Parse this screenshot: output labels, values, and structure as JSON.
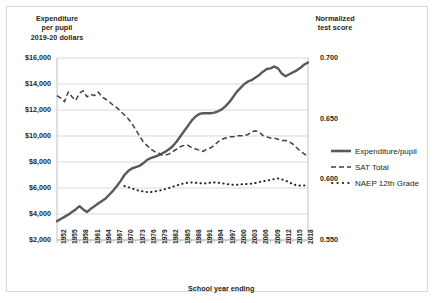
{
  "chart_data": {
    "type": "line",
    "title": "",
    "xlabel": "School year ending",
    "left_axis_title": "Expenditure\nper pupil\n2019-20 dollars",
    "left_axis_title_lines": [
      "Expenditure",
      "per pupil",
      "2019-20 dollars"
    ],
    "right_axis_title_lines": [
      "Normalized",
      "test score"
    ],
    "grid": true,
    "legend_position": "right",
    "y_left": {
      "label": "Expenditure per pupil 2019-20 dollars",
      "ticks": [
        "$2,000",
        "$4,000",
        "$6,000",
        "$8,000",
        "$10,000",
        "$12,000",
        "$14,000",
        "$16,000"
      ],
      "tick_values": [
        2000,
        4000,
        6000,
        8000,
        10000,
        12000,
        14000,
        16000
      ],
      "ylim": [
        2000,
        16000
      ]
    },
    "y_right": {
      "label": "Normalized test score",
      "ticks": [
        "0.550",
        "0.600",
        "0.650",
        "0.700"
      ],
      "tick_values": [
        0.55,
        0.6,
        0.65,
        0.7
      ],
      "ylim": [
        0.55,
        0.7
      ]
    },
    "x_ticks": [
      "1952",
      "1955",
      "1958",
      "1961",
      "1964",
      "1967",
      "1970",
      "1973",
      "1976",
      "1979",
      "1982",
      "1985",
      "1988",
      "1991",
      "1994",
      "1997",
      "2000",
      "2003",
      "2006",
      "2009",
      "2012",
      "2015",
      "2018"
    ],
    "xlim": [
      1952,
      2019
    ],
    "series": [
      {
        "name": "Expenditure/pupil",
        "axis": "left",
        "style": "solid",
        "color": "#595959",
        "x": [
          1952,
          1953,
          1954,
          1955,
          1956,
          1957,
          1958,
          1959,
          1960,
          1961,
          1962,
          1963,
          1964,
          1965,
          1966,
          1967,
          1968,
          1969,
          1970,
          1971,
          1972,
          1973,
          1974,
          1975,
          1976,
          1977,
          1978,
          1979,
          1980,
          1981,
          1982,
          1983,
          1984,
          1985,
          1986,
          1987,
          1988,
          1989,
          1990,
          1991,
          1992,
          1993,
          1994,
          1995,
          1996,
          1997,
          1998,
          1999,
          2000,
          2001,
          2002,
          2003,
          2004,
          2005,
          2006,
          2007,
          2008,
          2009,
          2010,
          2011,
          2012,
          2013,
          2014,
          2015,
          2016,
          2017,
          2018,
          2019
        ],
        "values": [
          3450,
          3620,
          3780,
          3950,
          4150,
          4350,
          4600,
          4350,
          4150,
          4400,
          4600,
          4800,
          5000,
          5200,
          5500,
          5800,
          6150,
          6550,
          7000,
          7300,
          7500,
          7600,
          7700,
          7900,
          8150,
          8300,
          8400,
          8500,
          8650,
          8800,
          9000,
          9250,
          9600,
          10000,
          10400,
          10800,
          11200,
          11500,
          11700,
          11750,
          11750,
          11750,
          11800,
          11900,
          12050,
          12300,
          12600,
          13000,
          13400,
          13700,
          14000,
          14200,
          14300,
          14500,
          14700,
          14950,
          15150,
          15200,
          15350,
          15200,
          14800,
          14600,
          14750,
          14900,
          15050,
          15250,
          15500,
          15650
        ]
      },
      {
        "name": "SAT Total",
        "axis": "right",
        "style": "dashed",
        "color": "#404040",
        "x": [
          1952,
          1953,
          1954,
          1955,
          1956,
          1957,
          1958,
          1959,
          1960,
          1961,
          1962,
          1963,
          1964,
          1965,
          1966,
          1967,
          1968,
          1969,
          1970,
          1971,
          1972,
          1973,
          1974,
          1975,
          1976,
          1977,
          1978,
          1979,
          1980,
          1981,
          1982,
          1983,
          1984,
          1985,
          1986,
          1987,
          1988,
          1989,
          1990,
          1991,
          1992,
          1993,
          1994,
          1995,
          1996,
          1997,
          1998,
          1999,
          2000,
          2001,
          2002,
          2003,
          2004,
          2005,
          2006,
          2007,
          2008,
          2009,
          2010,
          2011,
          2012,
          2013,
          2014,
          2015,
          2016,
          2017,
          2018,
          2019
        ],
        "values": [
          0.669,
          0.667,
          0.664,
          0.672,
          0.668,
          0.665,
          0.671,
          0.673,
          0.668,
          0.67,
          0.669,
          0.672,
          0.668,
          0.666,
          0.664,
          0.661,
          0.659,
          0.656,
          0.653,
          0.65,
          0.646,
          0.641,
          0.636,
          0.631,
          0.628,
          0.625,
          0.623,
          0.622,
          0.62,
          0.62,
          0.621,
          0.623,
          0.625,
          0.627,
          0.628,
          0.628,
          0.626,
          0.625,
          0.624,
          0.623,
          0.625,
          0.626,
          0.628,
          0.631,
          0.633,
          0.634,
          0.635,
          0.635,
          0.636,
          0.636,
          0.636,
          0.637,
          0.639,
          0.64,
          0.639,
          0.636,
          0.635,
          0.634,
          0.634,
          0.633,
          0.632,
          0.632,
          0.631,
          0.629,
          0.626,
          0.623,
          0.621,
          0.619
        ]
      },
      {
        "name": "NAEP 12th Grade",
        "axis": "right",
        "style": "dotted",
        "color": "#262626",
        "x": [
          1970,
          1971,
          1972,
          1973,
          1974,
          1975,
          1976,
          1977,
          1978,
          1979,
          1980,
          1981,
          1982,
          1983,
          1984,
          1985,
          1986,
          1987,
          1988,
          1989,
          1990,
          1991,
          1992,
          1993,
          1994,
          1995,
          1996,
          1997,
          1998,
          1999,
          2000,
          2001,
          2002,
          2003,
          2004,
          2005,
          2006,
          2007,
          2008,
          2009,
          2010,
          2011,
          2012,
          2013,
          2014,
          2015,
          2016,
          2017,
          2018,
          2019
        ],
        "values": [
          0.5945,
          0.5935,
          0.5925,
          0.5915,
          0.5905,
          0.59,
          0.5895,
          0.5895,
          0.59,
          0.5905,
          0.5912,
          0.592,
          0.593,
          0.594,
          0.595,
          0.596,
          0.5968,
          0.5972,
          0.5975,
          0.5972,
          0.5968,
          0.5965,
          0.5968,
          0.5972,
          0.5975,
          0.5972,
          0.5968,
          0.5962,
          0.5958,
          0.5955,
          0.5955,
          0.5958,
          0.596,
          0.5962,
          0.5965,
          0.597,
          0.5978,
          0.5985,
          0.599,
          0.5995,
          0.6002,
          0.6008,
          0.6,
          0.599,
          0.5975,
          0.596,
          0.595,
          0.5948,
          0.595,
          0.5952
        ]
      }
    ],
    "legend": [
      "Expenditure/pupil",
      "SAT Total",
      "NAEP 12th Grade"
    ],
    "colors": {
      "expenditure": "#595959",
      "sat": "#404040",
      "naep": "#262626",
      "grid": "#d9d9d9",
      "axis": "#bfbfbf",
      "text": "#231f20"
    }
  }
}
